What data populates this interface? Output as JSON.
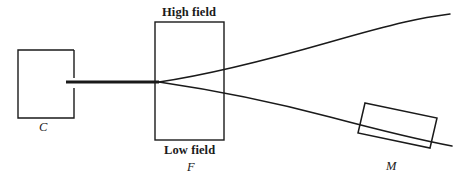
{
  "figure": {
    "type": "schematic-diagram",
    "background_color": "#ffffff",
    "stroke_color": "#1a1a1a",
    "width": 464,
    "height": 180
  },
  "labels": {
    "high_field": "High field",
    "low_field": "Low field",
    "collimator": "C",
    "field_magnet": "F",
    "detector": "M"
  },
  "components": [
    {
      "id": "collimator-box",
      "label": "C",
      "shape": "rectangle-with-right-slit",
      "x": 18,
      "y": 50,
      "width": 56,
      "height": 68,
      "slit_gap_top": 78,
      "slit_gap_bottom": 88
    },
    {
      "id": "field-box",
      "label": "F",
      "shape": "rectangle",
      "x": 155,
      "y": 22,
      "width": 69,
      "height": 118,
      "top_caption": "High field",
      "bottom_caption": "Low field"
    },
    {
      "id": "detector-box",
      "label": "M",
      "shape": "tilted-rectangle",
      "corners": [
        [
          365,
          103
        ],
        [
          437,
          118
        ],
        [
          430,
          148
        ],
        [
          358,
          133
        ]
      ],
      "tilt_degrees": 11.8
    }
  ],
  "beam": {
    "source_segment": {
      "description": "thick collimated beam from C to F entrance",
      "x1": 66,
      "y1": 82,
      "x2": 158,
      "y2": 82,
      "stroke_width": 3.2
    },
    "focal_point": {
      "x": 160,
      "y": 82
    },
    "traces": [
      {
        "id": "upper-trace",
        "description": "deflected beam rising toward upper right",
        "points": [
          [
            160,
            82
          ],
          [
            200,
            76
          ],
          [
            250,
            65
          ],
          [
            320,
            46
          ],
          [
            400,
            25
          ],
          [
            450,
            14
          ]
        ]
      },
      {
        "id": "lower-trace",
        "description": "deflected beam falling toward detector M",
        "points": [
          [
            160,
            82
          ],
          [
            200,
            88
          ],
          [
            250,
            97
          ],
          [
            320,
            114
          ],
          [
            400,
            134
          ],
          [
            452,
            146
          ]
        ]
      }
    ]
  }
}
